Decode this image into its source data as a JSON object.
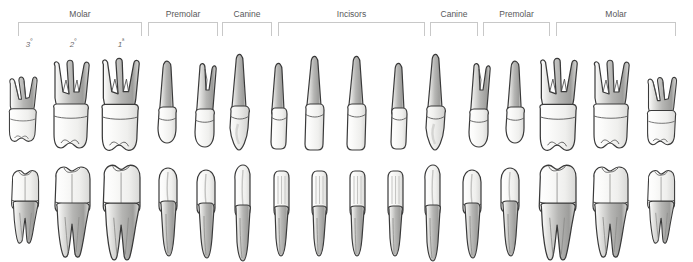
{
  "diagram": {
    "colors": {
      "outline": "#3a3a3a",
      "enamel_light": "#f4f4f2",
      "root_shade": "#b9b9b9",
      "bracket": "#c8c8c8",
      "label_text": "#58585a",
      "background": "#ffffff"
    }
  },
  "brackets": [
    {
      "label": "Molar",
      "x": 18,
      "width": 124,
      "label_x": 18,
      "label_width": 124
    },
    {
      "label": "Premolar",
      "x": 148,
      "width": 70,
      "label_x": 148,
      "label_width": 70
    },
    {
      "label": "Canine",
      "x": 222,
      "width": 50,
      "label_x": 222,
      "label_width": 50
    },
    {
      "label": "Incisors",
      "x": 278,
      "width": 147,
      "label_x": 278,
      "label_width": 147
    },
    {
      "label": "Canine",
      "x": 430,
      "width": 48,
      "label_x": 430,
      "label_width": 48
    },
    {
      "label": "Premolar",
      "x": 483,
      "width": 67,
      "label_x": 483,
      "label_width": 67
    },
    {
      "label": "Molar",
      "x": 556,
      "width": 120,
      "label_x": 556,
      "label_width": 120
    }
  ],
  "quadrant_numbers": [
    {
      "text": "3",
      "ordinal": "º",
      "x": 16,
      "width": 26
    },
    {
      "text": "2",
      "ordinal": "º",
      "x": 60,
      "width": 26
    },
    {
      "text": "1",
      "ordinal": "ª",
      "x": 108,
      "width": 26
    }
  ],
  "upper_teeth": [
    {
      "name": "third-molar",
      "type": "molar3",
      "x": 6,
      "scale": 0.86,
      "top": 22
    },
    {
      "name": "second-molar",
      "type": "molar",
      "x": 48,
      "scale": 1.0,
      "top": 10
    },
    {
      "name": "first-molar",
      "type": "molar",
      "x": 96,
      "scale": 1.05,
      "top": 8
    },
    {
      "name": "second-premolar",
      "type": "premolar1root",
      "x": 152,
      "scale": 1.0,
      "top": 10
    },
    {
      "name": "first-premolar",
      "type": "premolar2root",
      "x": 188,
      "scale": 1.0,
      "top": 12
    },
    {
      "name": "canine",
      "type": "canine",
      "x": 224,
      "scale": 1.0,
      "top": 4
    },
    {
      "name": "lateral-incisor",
      "type": "incisor-lateral",
      "x": 266,
      "scale": 1.0,
      "top": 12
    },
    {
      "name": "central-incisor",
      "type": "incisor-central",
      "x": 300,
      "scale": 1.0,
      "top": 6
    },
    {
      "name": "central-incisor",
      "type": "incisor-central",
      "x": 342,
      "scale": 1.0,
      "top": 6
    },
    {
      "name": "lateral-incisor",
      "type": "incisor-lateral",
      "x": 386,
      "scale": 1.0,
      "top": 12
    },
    {
      "name": "canine",
      "type": "canine",
      "x": 420,
      "scale": 1.0,
      "top": 4
    },
    {
      "name": "first-premolar",
      "type": "premolar2root",
      "x": 462,
      "scale": 1.0,
      "top": 12
    },
    {
      "name": "second-premolar",
      "type": "premolar1root",
      "x": 500,
      "scale": 1.0,
      "top": 10
    },
    {
      "name": "first-molar",
      "type": "molar",
      "x": 534,
      "scale": 1.05,
      "top": 8
    },
    {
      "name": "second-molar",
      "type": "molar",
      "x": 588,
      "scale": 1.0,
      "top": 10
    },
    {
      "name": "third-molar",
      "type": "molar3",
      "x": 644,
      "scale": 0.9,
      "top": 22
    }
  ],
  "lower_teeth": [
    {
      "name": "third-molar",
      "type": "lower-molar-small",
      "x": 8,
      "scale": 0.9,
      "top": 6
    },
    {
      "name": "second-molar",
      "type": "lower-molar",
      "x": 50,
      "scale": 1.0,
      "top": 2
    },
    {
      "name": "first-molar",
      "type": "lower-molar",
      "x": 98,
      "scale": 1.05,
      "top": 0
    },
    {
      "name": "second-premolar",
      "type": "lower-premolar",
      "x": 154,
      "scale": 1.0,
      "top": 4
    },
    {
      "name": "first-premolar",
      "type": "lower-premolar",
      "x": 192,
      "scale": 1.0,
      "top": 6
    },
    {
      "name": "canine",
      "type": "lower-canine",
      "x": 228,
      "scale": 1.0,
      "top": 2
    },
    {
      "name": "lateral-incisor",
      "type": "lower-incisor",
      "x": 268,
      "scale": 1.0,
      "top": 6
    },
    {
      "name": "central-incisor",
      "type": "lower-incisor",
      "x": 306,
      "scale": 1.0,
      "top": 6
    },
    {
      "name": "central-incisor",
      "type": "lower-incisor",
      "x": 344,
      "scale": 1.0,
      "top": 6
    },
    {
      "name": "lateral-incisor",
      "type": "lower-incisor",
      "x": 382,
      "scale": 1.0,
      "top": 6
    },
    {
      "name": "canine",
      "type": "lower-canine",
      "x": 418,
      "scale": 1.0,
      "top": 2
    },
    {
      "name": "first-premolar",
      "type": "lower-premolar",
      "x": 458,
      "scale": 1.0,
      "top": 6
    },
    {
      "name": "second-premolar",
      "type": "lower-premolar",
      "x": 496,
      "scale": 1.0,
      "top": 4
    },
    {
      "name": "first-molar",
      "type": "lower-molar",
      "x": 534,
      "scale": 1.05,
      "top": 0
    },
    {
      "name": "second-molar",
      "type": "lower-molar",
      "x": 588,
      "scale": 1.0,
      "top": 2
    },
    {
      "name": "third-molar",
      "type": "lower-molar-small",
      "x": 644,
      "scale": 0.9,
      "top": 6
    }
  ]
}
